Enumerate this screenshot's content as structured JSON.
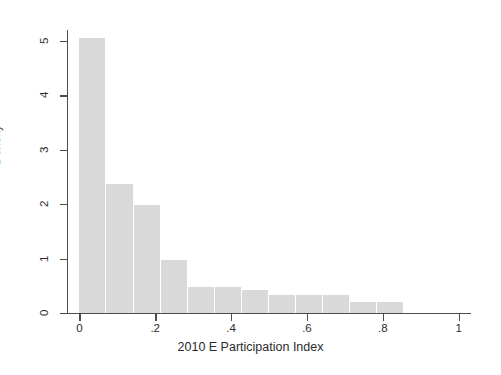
{
  "chart_data": {
    "type": "bar",
    "title": "",
    "subtitle": "",
    "xlabel": "2010 E Participation Index",
    "ylabel": "Density",
    "xlim": [
      -0.03,
      1.03
    ],
    "ylim": [
      0,
      5.2
    ],
    "grid": false,
    "legend": null,
    "bar_color": "#d9d9d9",
    "axis_color": "#4d4d4d",
    "background": "#ffffff",
    "xticks": [
      0,
      0.2,
      0.4,
      0.6,
      0.8,
      1
    ],
    "xtick_labels": [
      "0",
      ".2",
      ".4",
      ".6",
      ".8",
      "1"
    ],
    "yticks": [
      0,
      1,
      2,
      3,
      4,
      5
    ],
    "ytick_labels": [
      "0",
      "1",
      "2",
      "3",
      "4",
      "5"
    ],
    "bin_width": 0.0714,
    "bins": [
      {
        "x0": 0.0,
        "x1": 0.0714,
        "value": 5.06
      },
      {
        "x0": 0.0714,
        "x1": 0.1428,
        "value": 2.37
      },
      {
        "x0": 0.1428,
        "x1": 0.2142,
        "value": 1.99
      },
      {
        "x0": 0.2142,
        "x1": 0.2857,
        "value": 0.97
      },
      {
        "x0": 0.2857,
        "x1": 0.3571,
        "value": 0.47
      },
      {
        "x0": 0.3571,
        "x1": 0.4285,
        "value": 0.47
      },
      {
        "x0": 0.4285,
        "x1": 0.5,
        "value": 0.43
      },
      {
        "x0": 0.5,
        "x1": 0.5714,
        "value": 0.33
      },
      {
        "x0": 0.5714,
        "x1": 0.6428,
        "value": 0.33
      },
      {
        "x0": 0.6428,
        "x1": 0.7142,
        "value": 0.33
      },
      {
        "x0": 0.7142,
        "x1": 0.7857,
        "value": 0.2
      },
      {
        "x0": 0.7857,
        "x1": 0.8571,
        "value": 0.2
      }
    ]
  }
}
